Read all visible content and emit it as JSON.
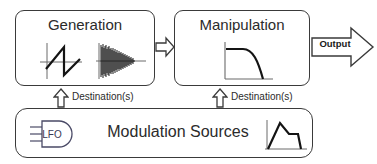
{
  "diagram": {
    "stroke_color": "#3a3a3a",
    "text_color": "#2b2b2b",
    "background_color": "#ffffff"
  },
  "generation": {
    "title": "Generation",
    "icons": [
      {
        "name": "sawtooth-waveform-icon",
        "label": "sawtooth wave"
      },
      {
        "name": "noise-burst-waveform-icon",
        "label": "noise burst"
      }
    ]
  },
  "manipulation": {
    "title": "Manipulation",
    "icons": [
      {
        "name": "lowpass-filter-curve-icon",
        "label": "lowpass filter response"
      }
    ]
  },
  "modulation": {
    "title": "Modulation Sources",
    "icons": [
      {
        "name": "lfo-icon",
        "label": "LFO"
      },
      {
        "name": "envelope-icon",
        "label": "envelope"
      }
    ],
    "lfo_label": "LFO"
  },
  "connectors": {
    "flow_arrow": "flow-arrow-right",
    "destination_label_1": "Destination(s)",
    "destination_label_2": "Destination(s)",
    "output_label": "Output"
  }
}
